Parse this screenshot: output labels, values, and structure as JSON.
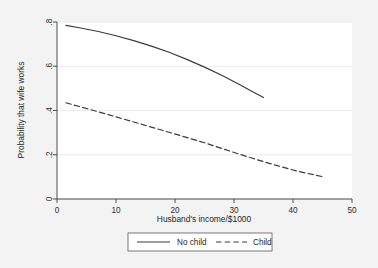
{
  "figure": {
    "background_color": "#f3f3f3",
    "plot_background_color": "#ffffff",
    "gridline_color": "#e9e9e9",
    "axis_color": "#3d3d3d",
    "line_color": "#3a3a3a"
  },
  "chart_data": {
    "type": "line",
    "title": "",
    "xlabel": "Husband's income/$1000",
    "ylabel": "Probability that wife works",
    "xlim": [
      0,
      50
    ],
    "ylim": [
      0,
      0.8
    ],
    "xticks": [
      0,
      10,
      20,
      30,
      40,
      50
    ],
    "xtick_labels": [
      "0",
      "10",
      "20",
      "30",
      "40",
      "50"
    ],
    "yticks": [
      0,
      0.2,
      0.4,
      0.6,
      0.8
    ],
    "ytick_labels": [
      "0",
      ".2",
      ".4",
      ".6",
      ".8"
    ],
    "grid": "horizontal",
    "legend_position": "below-axes",
    "series": [
      {
        "name": "No child",
        "style": "solid",
        "x": [
          1.5,
          4,
          7,
          10,
          13,
          16,
          19,
          22,
          25,
          28,
          31,
          33,
          35
        ],
        "y": [
          0.785,
          0.773,
          0.757,
          0.738,
          0.716,
          0.691,
          0.663,
          0.631,
          0.596,
          0.558,
          0.516,
          0.487,
          0.459
        ]
      },
      {
        "name": "Child",
        "style": "dashed",
        "x": [
          1.5,
          5,
          9,
          13,
          17,
          21,
          25,
          29,
          33,
          37,
          41,
          45
        ],
        "y": [
          0.435,
          0.409,
          0.379,
          0.348,
          0.317,
          0.286,
          0.254,
          0.219,
          0.185,
          0.153,
          0.124,
          0.101
        ]
      }
    ]
  },
  "legend": {
    "entries": [
      {
        "label": "No child",
        "style": "solid"
      },
      {
        "label": "Child",
        "style": "dashed"
      }
    ]
  }
}
